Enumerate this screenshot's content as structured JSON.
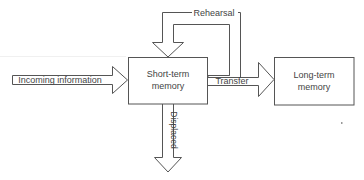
{
  "diagram": {
    "type": "memory-model-flowchart",
    "colors": {
      "stroke": "#555555",
      "text": "#444444",
      "background": "#ffffff"
    },
    "nodes": [
      {
        "id": "stm",
        "label_line1": "Short-term",
        "label_line2": "memory"
      },
      {
        "id": "ltm",
        "label_line1": "Long-term",
        "label_line2": "memory"
      }
    ],
    "arrows": {
      "incoming": "Incoming information",
      "rehearsal": "Rehearsal",
      "transfer": "Transfer",
      "displaced": "Displaced"
    }
  }
}
